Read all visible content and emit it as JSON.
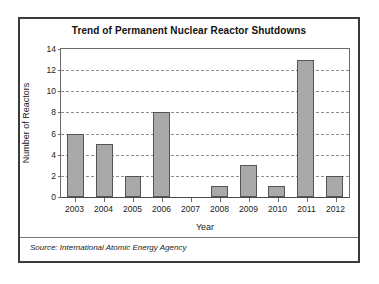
{
  "figure": {
    "source_note": "Source: International Atomic Energy Agency",
    "colors": {
      "bar_fill": "#a9a9a9",
      "bar_border": "#555555",
      "frame": "#3a3a3a",
      "grid": "#8d8d8d",
      "axis": "#6b6b6b",
      "background": "#ffffff",
      "text": "#1a1a1a"
    }
  },
  "chart_data": {
    "type": "bar",
    "title": "Trend of Permanent Nuclear Reactor Shutdowns",
    "xlabel": "Year",
    "ylabel": "Number of Reactors",
    "categories": [
      "2003",
      "2004",
      "2005",
      "2006",
      "2007",
      "2008",
      "2009",
      "2010",
      "2011",
      "2012"
    ],
    "values": [
      6,
      5,
      2,
      8,
      0,
      1,
      3,
      1,
      13,
      2
    ],
    "ylim": [
      0,
      14
    ],
    "yticks": [
      0,
      2,
      4,
      6,
      8,
      10,
      12,
      14
    ],
    "ytick_labels": [
      "0",
      "2",
      "4",
      "6",
      "8",
      "10",
      "12",
      "14"
    ],
    "grid": true,
    "grid_axis": "y",
    "legend": false,
    "series": [
      {
        "name": "Permanent nuclear reactor shutdowns",
        "values": [
          6,
          5,
          2,
          8,
          0,
          1,
          3,
          1,
          13,
          2
        ]
      }
    ]
  }
}
